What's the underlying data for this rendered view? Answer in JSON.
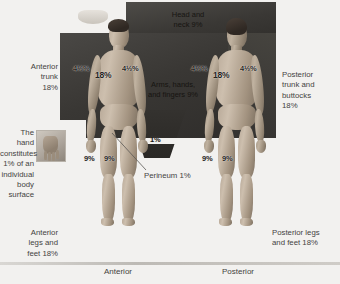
{
  "diagram": {
    "captions": {
      "anterior": "Anterior",
      "posterior": "Posterior"
    },
    "labels": {
      "head_neck": "Head and\nneck 9%",
      "arms": "Arms, hands,\nand fingers 9%",
      "anterior_trunk": "Anterior\ntrunk\n18%",
      "posterior_trunk": "Posterior\ntrunk and\nbuttocks\n18%",
      "hand_note": "The\nhand\nconstitutes\n1% of an\nindividual\nbody\nsurface",
      "anterior_legs": "Anterior\nlegs and\nfeet 18%",
      "posterior_legs": "Posterior legs\nand feet 18%",
      "perineum": "Perineum 1%"
    },
    "percentages": {
      "anterior_arm_left": "4½%",
      "anterior_arm_right": "4½%",
      "anterior_trunk_pct": "18%",
      "anterior_leg_left": "9%",
      "anterior_leg_right": "9%",
      "posterior_arm_left": "4½%",
      "posterior_arm_right": "4½%",
      "posterior_trunk_pct": "18%",
      "posterior_leg_left": "9%",
      "posterior_leg_right": "9%",
      "perineum_pct": "1%"
    },
    "colors": {
      "backdrop": "#3c3b39",
      "page": "#f2f1ef",
      "text": "#44433f",
      "skin": "#b9aa99"
    }
  }
}
